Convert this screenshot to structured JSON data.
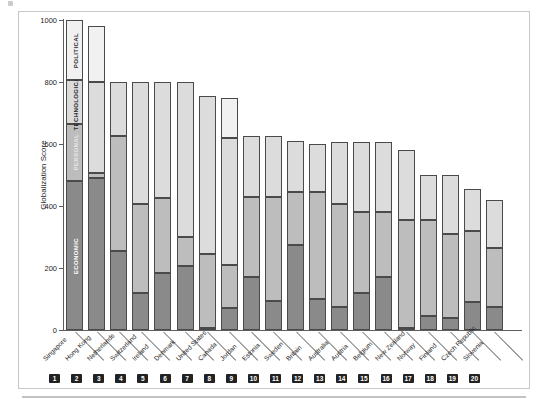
{
  "figure": {
    "y_axis_label": "Globalization Score",
    "y_ticks": [
      0,
      200,
      400,
      600,
      800,
      1000
    ]
  },
  "legend": {
    "entries": [
      {
        "key": "economic",
        "label": "ECONOMIC",
        "color": "#8a8a8a"
      },
      {
        "key": "personal",
        "label": "PERSONAL",
        "color": "#bdbdbd"
      },
      {
        "key": "technological",
        "label": "TECHNOLOGICAL",
        "color": "#dcdcdc"
      },
      {
        "key": "political",
        "label": "POLITICAL",
        "color": "#f1f1f1"
      }
    ]
  },
  "chart_data": {
    "type": "bar",
    "stacked": true,
    "title": "",
    "xlabel": "",
    "ylabel": "Globalization Score",
    "ylim": [
      0,
      1000
    ],
    "yticks": [
      0,
      200,
      400,
      600,
      800,
      1000
    ],
    "grid": false,
    "legend_position": "inside-first-bar",
    "categories": [
      "Singapore",
      "Hong Kong",
      "Netherlands",
      "Switzerland",
      "Ireland",
      "Denmark",
      "United States",
      "Canada",
      "Jordan",
      "Estonia",
      "Sweden",
      "Britain",
      "Australia",
      "Austria",
      "Belgium",
      "New Zealand",
      "Norway",
      "Finland",
      "Czech Republic",
      "Slovenia"
    ],
    "ranks": [
      1,
      2,
      3,
      4,
      5,
      6,
      7,
      8,
      9,
      10,
      11,
      12,
      13,
      14,
      15,
      16,
      17,
      18,
      19,
      20
    ],
    "series": [
      {
        "name": "ECONOMIC",
        "color": "#8a8a8a",
        "values": [
          480,
          490,
          255,
          120,
          185,
          205,
          8,
          70,
          170,
          95,
          275,
          100,
          75,
          120,
          170,
          5,
          45,
          40,
          90,
          75
        ]
      },
      {
        "name": "PERSONAL",
        "color": "#bdbdbd",
        "values": [
          185,
          15,
          370,
          285,
          240,
          95,
          237,
          140,
          260,
          335,
          170,
          345,
          330,
          260,
          210,
          350,
          310,
          270,
          230,
          190
        ]
      },
      {
        "name": "TECHNOLOGICAL",
        "color": "#dcdcdc",
        "values": [
          140,
          295,
          175,
          395,
          375,
          500,
          510,
          410,
          195,
          195,
          165,
          155,
          200,
          225,
          225,
          225,
          145,
          190,
          135,
          155
        ]
      },
      {
        "name": "POLITICAL",
        "color": "#f1f1f1",
        "values": [
          195,
          180,
          0,
          0,
          0,
          0,
          0,
          130,
          0,
          0,
          0,
          0,
          0,
          0,
          0,
          0,
          0,
          0,
          0,
          0
        ]
      }
    ],
    "totals": [
      1000,
      980,
      800,
      800,
      800,
      800,
      755,
      750,
      625,
      625,
      610,
      600,
      605,
      605,
      605,
      580,
      500,
      500,
      455,
      420
    ],
    "bars": [
      {
        "rank": 1,
        "category": "Singapore",
        "economic": 480,
        "personal": 185,
        "technological": 140,
        "political": 195,
        "total": 1000
      },
      {
        "rank": 2,
        "category": "Hong Kong",
        "economic": 490,
        "personal": 15,
        "technological": 295,
        "political": 180,
        "total": 980
      },
      {
        "rank": 3,
        "category": "Netherlands",
        "economic": 255,
        "personal": 370,
        "technological": 175,
        "political": 0,
        "total": 800
      },
      {
        "rank": 4,
        "category": "Switzerland",
        "economic": 120,
        "personal": 285,
        "technological": 395,
        "political": 0,
        "total": 800
      },
      {
        "rank": 5,
        "category": "Ireland",
        "economic": 185,
        "personal": 240,
        "technological": 375,
        "political": 0,
        "total": 800
      },
      {
        "rank": 6,
        "category": "Denmark",
        "economic": 205,
        "personal": 95,
        "technological": 500,
        "political": 0,
        "total": 800
      },
      {
        "rank": 7,
        "category": "United States",
        "economic": 8,
        "personal": 237,
        "technological": 510,
        "political": 0,
        "total": 755
      },
      {
        "rank": 8,
        "category": "Canada",
        "economic": 70,
        "personal": 140,
        "technological": 410,
        "political": 130,
        "total": 750
      },
      {
        "rank": 9,
        "category": "Jordan",
        "economic": 170,
        "personal": 260,
        "technological": 195,
        "political": 0,
        "total": 625
      },
      {
        "rank": 10,
        "category": "Estonia",
        "economic": 95,
        "personal": 335,
        "technological": 195,
        "political": 0,
        "total": 625
      },
      {
        "rank": 11,
        "category": "Sweden",
        "economic": 275,
        "personal": 170,
        "technological": 165,
        "political": 0,
        "total": 610
      },
      {
        "rank": 12,
        "category": "Britain",
        "economic": 100,
        "personal": 345,
        "technological": 155,
        "political": 0,
        "total": 600
      },
      {
        "rank": 13,
        "category": "Australia",
        "economic": 75,
        "personal": 330,
        "technological": 200,
        "political": 0,
        "total": 605
      },
      {
        "rank": 14,
        "category": "Austria",
        "economic": 120,
        "personal": 260,
        "technological": 225,
        "political": 0,
        "total": 605
      },
      {
        "rank": 15,
        "category": "Belgium",
        "economic": 170,
        "personal": 210,
        "technological": 225,
        "political": 0,
        "total": 605
      },
      {
        "rank": 16,
        "category": "New Zealand",
        "economic": 5,
        "personal": 350,
        "technological": 225,
        "political": 0,
        "total": 580
      },
      {
        "rank": 17,
        "category": "Norway",
        "economic": 45,
        "personal": 310,
        "technological": 145,
        "political": 0,
        "total": 500
      },
      {
        "rank": 18,
        "category": "Finland",
        "economic": 40,
        "personal": 270,
        "technological": 190,
        "political": 0,
        "total": 500
      },
      {
        "rank": 19,
        "category": "Czech Republic",
        "economic": 90,
        "personal": 230,
        "technological": 135,
        "political": 0,
        "total": 455
      },
      {
        "rank": 20,
        "category": "Slovenia",
        "economic": 75,
        "personal": 190,
        "technological": 155,
        "political": 0,
        "total": 420
      }
    ]
  }
}
